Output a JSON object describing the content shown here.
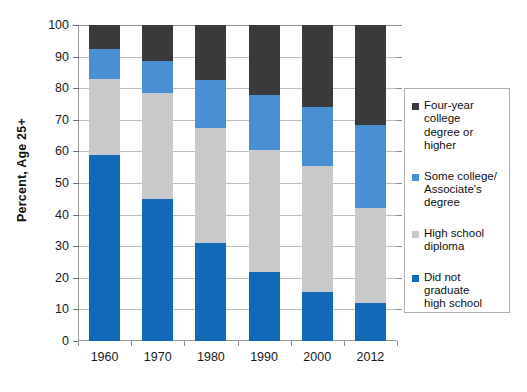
{
  "chart_data": {
    "type": "bar",
    "subtype": "stacked-column",
    "title": "",
    "xlabel": "",
    "ylabel": "Percent, Age 25+",
    "ylim": [
      0,
      100
    ],
    "yticks": [
      0,
      10,
      20,
      30,
      40,
      50,
      60,
      70,
      80,
      90,
      100
    ],
    "ytick_labels": [
      "0",
      "10",
      "20",
      "30",
      "40",
      "50",
      "60",
      "70",
      "80",
      "90",
      "100"
    ],
    "grid": true,
    "legend_position": "right",
    "categories": [
      "1960",
      "1970",
      "1980",
      "1990",
      "2000",
      "2012"
    ],
    "series": [
      {
        "name": "Did not graduate high school",
        "legend_label": "Did not graduate\nhigh school",
        "color": "#1269B8",
        "values": [
          59.0,
          44.8,
          31.0,
          21.8,
          15.5,
          12.0
        ]
      },
      {
        "name": "High school diploma",
        "legend_label": "High school\ndiploma",
        "color": "#C8C9CB",
        "values": [
          24.0,
          33.7,
          36.5,
          38.7,
          40.0,
          30.0
        ]
      },
      {
        "name": "Some college/Associate's degree",
        "legend_label": "Some college/\nAssociate's\ndegree",
        "color": "#4A8FD4",
        "values": [
          9.5,
          10.2,
          15.0,
          17.2,
          18.5,
          26.5
        ]
      },
      {
        "name": "Four-year college degree or higher",
        "legend_label": "Four-year college\ndegree or higher",
        "color": "#3A3A3C",
        "values": [
          7.5,
          11.3,
          17.5,
          22.3,
          26.0,
          31.5
        ]
      }
    ],
    "cumulative_tops": {
      "1960": [
        59.0,
        83.0,
        92.5,
        100
      ],
      "1970": [
        44.8,
        78.5,
        88.7,
        100
      ],
      "1980": [
        31.0,
        67.5,
        82.5,
        100
      ],
      "1990": [
        21.8,
        60.5,
        77.7,
        100
      ],
      "2000": [
        15.5,
        55.5,
        74.0,
        100
      ],
      "2012": [
        12.0,
        42.0,
        68.5,
        100
      ]
    }
  },
  "legend": {
    "items": [
      {
        "label": "Four-year college\ndegree or higher",
        "color": "#3A3A3C"
      },
      {
        "label": "Some college/\nAssociate's\ndegree",
        "color": "#4A8FD4"
      },
      {
        "label": "High school\ndiploma",
        "color": "#C8C9CB"
      },
      {
        "label": "Did not graduate\nhigh school",
        "color": "#1269B8"
      }
    ]
  }
}
